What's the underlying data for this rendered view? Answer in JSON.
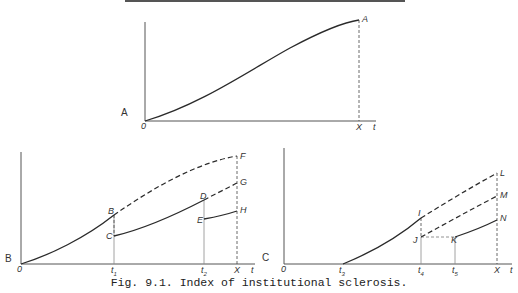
{
  "figure": {
    "caption": "Fig. 9.1.  Index of institutional sclerosis.",
    "top_rule": true
  },
  "panels": {
    "A": {
      "panel_label": "A",
      "origin": "0",
      "x_axis_label": "t",
      "ticks": [
        "X"
      ],
      "points": [
        "A"
      ]
    },
    "B": {
      "panel_label": "B",
      "origin": "0",
      "x_axis_label": "t",
      "ticks": [
        {
          "main": "t",
          "sub": "1"
        },
        {
          "main": "t",
          "sub": "2"
        },
        "X"
      ],
      "points": [
        "B",
        "C",
        "D",
        "E",
        "F",
        "G",
        "H"
      ]
    },
    "C": {
      "panel_label": "C",
      "origin": "0",
      "x_axis_label": "t",
      "ticks": [
        {
          "main": "t",
          "sub": "3"
        },
        {
          "main": "t",
          "sub": "4"
        },
        {
          "main": "t",
          "sub": "5"
        },
        "X"
      ],
      "points": [
        "I",
        "J",
        "K",
        "L",
        "M",
        "N"
      ]
    }
  },
  "colors": {
    "line": "#2a2a2a",
    "axis": "#555555",
    "guide": "#8a8a8a"
  }
}
